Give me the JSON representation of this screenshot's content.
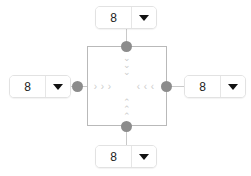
{
  "widget": {
    "name": "spacing-editor",
    "unit_suffix": "",
    "colors": {
      "box_border": "#b9b9b9",
      "handle": "#8c8c8c",
      "chevron": "#cccccc",
      "field_border": "#e2e2e2",
      "connector": "#c9c9c9",
      "text": "#222222"
    }
  },
  "fields": {
    "top": {
      "value": "8",
      "placeholder": "0",
      "caret_icon": "chevron-down-icon"
    },
    "right": {
      "value": "8",
      "placeholder": "0",
      "caret_icon": "chevron-down-icon"
    },
    "bottom": {
      "value": "8",
      "placeholder": "0",
      "caret_icon": "chevron-down-icon"
    },
    "left": {
      "value": "8",
      "placeholder": "0",
      "caret_icon": "chevron-down-icon"
    }
  },
  "indicators": {
    "top": {
      "icon": "chevron-down-icon",
      "glyph": "⌄",
      "count": 3,
      "direction": "inward-down"
    },
    "bottom": {
      "icon": "chevron-up-icon",
      "glyph": "⌃",
      "count": 3,
      "direction": "inward-up"
    },
    "left": {
      "icon": "chevron-right-icon",
      "glyph": "›",
      "count": 3,
      "direction": "inward-right"
    },
    "right": {
      "icon": "chevron-left-icon",
      "glyph": "‹",
      "count": 3,
      "direction": "inward-left"
    }
  },
  "handles": {
    "top": {
      "name": "handle-top"
    },
    "right": {
      "name": "handle-right"
    },
    "bottom": {
      "name": "handle-bottom"
    },
    "left": {
      "name": "handle-left"
    }
  }
}
